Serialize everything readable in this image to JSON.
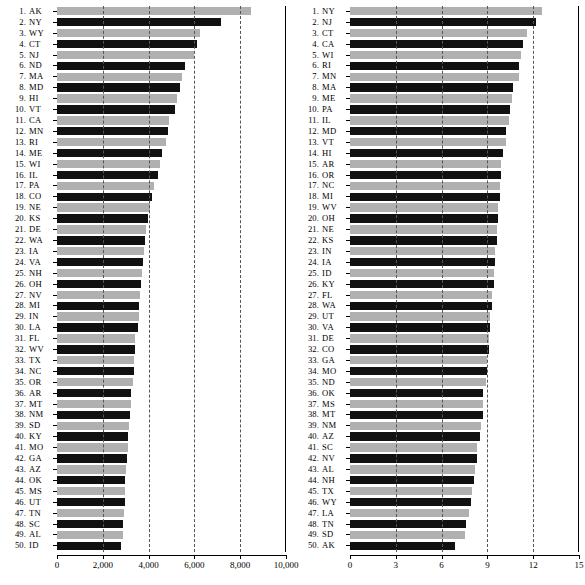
{
  "chart_data": [
    {
      "panel_id": "left",
      "type": "bar",
      "orientation": "horizontal",
      "title": "",
      "xlabel": "",
      "ylabel": "",
      "xlim": [
        0,
        10000
      ],
      "xticks": [
        0,
        2000,
        4000,
        6000,
        8000,
        10000
      ],
      "xtick_labels": [
        "0",
        "2,000",
        "4,000",
        "6,000",
        "8,000",
        "10,000"
      ],
      "gridlines_at": [
        2000,
        4000,
        6000,
        8000
      ],
      "grid": true,
      "legend": "none",
      "bar_colors": {
        "odd": "#b0b0b0",
        "even": "#111111"
      },
      "categories": [
        "AK",
        "NY",
        "WY",
        "CT",
        "NJ",
        "ND",
        "MA",
        "MD",
        "HI",
        "VT",
        "CA",
        "MN",
        "RI",
        "ME",
        "WI",
        "IL",
        "PA",
        "CO",
        "NE",
        "KS",
        "DE",
        "WA",
        "IA",
        "VA",
        "NH",
        "OH",
        "NV",
        "MI",
        "IN",
        "LA",
        "FL",
        "WV",
        "TX",
        "NC",
        "OR",
        "AR",
        "MT",
        "NM",
        "SD",
        "KY",
        "MO",
        "GA",
        "AZ",
        "OK",
        "MS",
        "UT",
        "TN",
        "SC",
        "AL",
        "ID"
      ],
      "ranks": [
        1,
        2,
        3,
        4,
        5,
        6,
        7,
        8,
        9,
        10,
        11,
        12,
        13,
        14,
        15,
        16,
        17,
        18,
        19,
        20,
        21,
        22,
        23,
        24,
        25,
        26,
        27,
        28,
        29,
        30,
        31,
        32,
        33,
        34,
        35,
        36,
        37,
        38,
        39,
        40,
        41,
        42,
        43,
        44,
        45,
        46,
        47,
        48,
        49,
        50
      ],
      "values": [
        8450,
        7150,
        6250,
        6100,
        6000,
        5600,
        5450,
        5350,
        5250,
        5150,
        4900,
        4850,
        4750,
        4600,
        4500,
        4400,
        4250,
        4150,
        4050,
        3980,
        3900,
        3850,
        3800,
        3760,
        3720,
        3680,
        3640,
        3600,
        3570,
        3520,
        3420,
        3400,
        3380,
        3350,
        3320,
        3250,
        3230,
        3200,
        3150,
        3100,
        3080,
        3050,
        3020,
        2990,
        2970,
        2950,
        2930,
        2900,
        2870,
        2800
      ]
    },
    {
      "panel_id": "right",
      "type": "bar",
      "orientation": "horizontal",
      "title": "",
      "xlabel": "",
      "ylabel": "",
      "xlim": [
        0,
        15
      ],
      "xticks": [
        0,
        3,
        6,
        9,
        12,
        15
      ],
      "xtick_labels": [
        "0",
        "3",
        "6",
        "9",
        "12",
        "15"
      ],
      "gridlines_at": [
        3,
        6,
        9,
        12
      ],
      "grid": true,
      "legend": "none",
      "bar_colors": {
        "odd": "#b0b0b0",
        "even": "#111111"
      },
      "categories": [
        "NY",
        "NJ",
        "CT",
        "CA",
        "WI",
        "RI",
        "MN",
        "MA",
        "ME",
        "PA",
        "IL",
        "MD",
        "VT",
        "HI",
        "AR",
        "OR",
        "NC",
        "MI",
        "WV",
        "OH",
        "NE",
        "KS",
        "IN",
        "IA",
        "ID",
        "KY",
        "FL",
        "WA",
        "UT",
        "VA",
        "DE",
        "CO",
        "GA",
        "MO",
        "ND",
        "OK",
        "MS",
        "MT",
        "NM",
        "AZ",
        "SC",
        "NV",
        "AL",
        "NH",
        "TX",
        "WY",
        "LA",
        "TN",
        "SD",
        "AK"
      ],
      "ranks": [
        1,
        2,
        3,
        4,
        5,
        6,
        7,
        8,
        9,
        10,
        11,
        12,
        13,
        14,
        15,
        16,
        17,
        18,
        19,
        20,
        21,
        22,
        23,
        24,
        25,
        26,
        27,
        28,
        29,
        30,
        31,
        32,
        33,
        34,
        35,
        36,
        37,
        38,
        39,
        40,
        41,
        42,
        43,
        44,
        45,
        46,
        47,
        48,
        49,
        50
      ],
      "values": [
        12.6,
        12.2,
        11.6,
        11.3,
        11.2,
        11.1,
        11.1,
        10.7,
        10.6,
        10.5,
        10.4,
        10.2,
        10.2,
        10.0,
        9.9,
        9.9,
        9.8,
        9.8,
        9.7,
        9.7,
        9.6,
        9.6,
        9.5,
        9.5,
        9.4,
        9.4,
        9.3,
        9.3,
        9.2,
        9.2,
        9.1,
        9.1,
        9.0,
        9.0,
        8.9,
        8.7,
        8.7,
        8.7,
        8.6,
        8.5,
        8.3,
        8.3,
        8.2,
        8.1,
        8.0,
        7.9,
        7.8,
        7.6,
        7.5,
        6.9
      ]
    }
  ],
  "panels": {
    "left": {
      "title": "",
      "tick_labels": [
        "0",
        "2,000",
        "4,000",
        "6,000",
        "8,000",
        "10,000"
      ]
    },
    "right": {
      "title": "",
      "tick_labels": [
        "0",
        "3",
        "6",
        "9",
        "12",
        "15"
      ]
    }
  }
}
